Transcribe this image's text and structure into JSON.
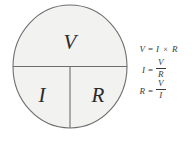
{
  "diagram": {
    "circle": {
      "fill_color": "#f2f2f1",
      "stroke_color": "#6e6e6e",
      "divider_color": "#6e6e6e",
      "segments": [
        {
          "id": "top",
          "label": "V",
          "meaning": "voltage"
        },
        {
          "id": "bottom-left",
          "label": "I",
          "meaning": "current"
        },
        {
          "id": "bottom-right",
          "label": "R",
          "meaning": "resistance"
        }
      ]
    }
  },
  "formulas": [
    {
      "id": "voltage",
      "lhs": "V",
      "equals": "=",
      "rhs_type": "product",
      "factor_a": "I",
      "operator": "×",
      "factor_b": "R",
      "text": "V = I × R"
    },
    {
      "id": "current",
      "lhs": "I",
      "equals": "=",
      "rhs_type": "fraction",
      "numerator": "V",
      "denominator": "R",
      "text": "I = V / R"
    },
    {
      "id": "resistance",
      "lhs": "R",
      "equals": "=",
      "rhs_type": "fraction",
      "numerator": "V",
      "denominator": "I",
      "text": "R = V / I"
    }
  ],
  "colors": {
    "background": "#ffffff",
    "circle_fill": "#f2f2f1",
    "line": "#6e6e6e",
    "letter_text": "#2b2b2b",
    "formula_text": "#3a3a3a"
  }
}
